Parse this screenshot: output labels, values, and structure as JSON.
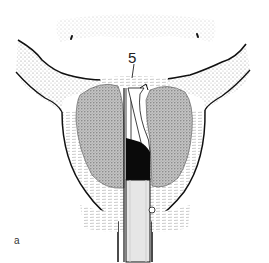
{
  "figure": {
    "panel_label": "a",
    "callouts": [
      {
        "number": "5",
        "target": "bladder-neck-strip"
      }
    ],
    "structures": [
      "bladder-outline",
      "pelvic-floor-left",
      "pelvic-floor-right",
      "prostate-capsule",
      "prostate-lobe-left",
      "prostate-lobe-right",
      "urethral-instrument",
      "sphincter-tissue"
    ],
    "colors": {
      "line": "#111111",
      "stipple": "#9a9a9a",
      "lobe_fill": "#b8b8b8",
      "instrument_fill": "#e6e6e6",
      "black_fill": "#0a0a0a",
      "background": "#ffffff"
    }
  }
}
